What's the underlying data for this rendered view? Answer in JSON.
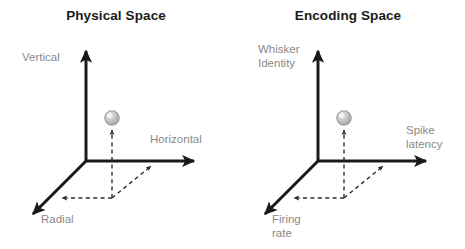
{
  "figure": {
    "background_color": "#ffffff",
    "axis_color": "#1a1a1a",
    "label_color": "#8a8a8a",
    "title_color": "#1a1a1a",
    "dashed_color": "#6b6b6b",
    "sphere_fill": "#bdbdbd",
    "sphere_highlight": "#efefef",
    "sphere_stroke": "#9a9a9a"
  },
  "panels": [
    {
      "id": "physical",
      "title": "Physical Space",
      "axes": {
        "vertical": "Vertical",
        "horizontal": "Horizontal",
        "depth": "Radial"
      }
    },
    {
      "id": "encoding",
      "title": "Encoding Space",
      "axes": {
        "vertical_line1": "Whisker",
        "vertical_line2": "Identity",
        "horizontal_line1": "Spike",
        "horizontal_line2": "latency",
        "depth_line1": "Firing",
        "depth_line2": "rate"
      }
    }
  ]
}
